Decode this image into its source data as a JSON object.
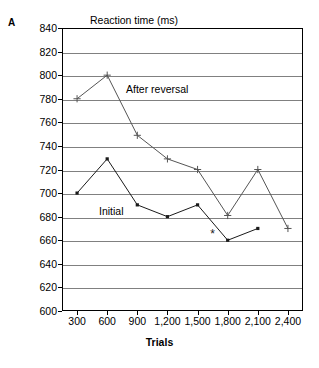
{
  "panel": {
    "label": "A"
  },
  "axes": {
    "y_title": "Reaction time (ms)",
    "x_title": "Trials"
  },
  "annotations": {
    "after_reversal": "After reversal",
    "initial": "Initial"
  },
  "colors": {
    "axis": "#000000",
    "gridline": "#808080",
    "initial_series": "#1a1a1a",
    "after_reversal_series": "#555555",
    "background": "#ffffff"
  },
  "chart_data": {
    "type": "line",
    "title": "",
    "xlabel": "Trials",
    "ylabel": "Reaction time (ms)",
    "xlim": [
      150,
      2550
    ],
    "ylim": [
      600,
      840
    ],
    "ytick_step": 20,
    "grid": true,
    "legend": "inline-annotations",
    "categories": [
      300,
      600,
      900,
      1200,
      1500,
      1800,
      2100,
      2400
    ],
    "xtick_labels": [
      "300",
      "600",
      "900",
      "1,200",
      "1,500",
      "1,800",
      "2,100",
      "2,400"
    ],
    "ytick_labels": [
      "600",
      "620",
      "640",
      "660",
      "680",
      "700",
      "720",
      "740",
      "760",
      "780",
      "800",
      "820",
      "840"
    ],
    "ytick_values": [
      600,
      620,
      640,
      660,
      680,
      700,
      720,
      740,
      760,
      780,
      800,
      820,
      840
    ],
    "series": [
      {
        "name": "After reversal",
        "marker": "plus",
        "x": [
          300,
          600,
          900,
          1200,
          1500,
          1800,
          2100,
          2400
        ],
        "values": [
          780,
          800,
          749,
          729,
          720,
          681,
          720,
          670
        ]
      },
      {
        "name": "Initial",
        "marker": "square",
        "x": [
          300,
          600,
          900,
          1200,
          1500,
          1800,
          2100
        ],
        "values": [
          700,
          729,
          690,
          680,
          690,
          660,
          670
        ]
      }
    ],
    "markers_extra": [
      {
        "name": "significance-star",
        "symbol": "*",
        "x": 1650,
        "y": 665
      }
    ]
  }
}
